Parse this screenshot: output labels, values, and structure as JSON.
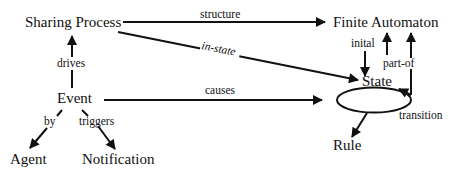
{
  "nodes": {
    "sharing_process": "Sharing Process",
    "finite_automaton": "Finite Automaton",
    "state": "State",
    "event": "Event",
    "agent": "Agent",
    "notification": "Notification",
    "rule": "Rule"
  },
  "edges": {
    "structure": "structure",
    "in_state": "in-state",
    "inital": "inital",
    "part_of": "part-of",
    "drives": "drives",
    "causes": "causes",
    "by": "by",
    "triggers": "triggers",
    "transition": "transition"
  },
  "colors": {
    "ink": "#111111",
    "background": "#ffffff"
  }
}
